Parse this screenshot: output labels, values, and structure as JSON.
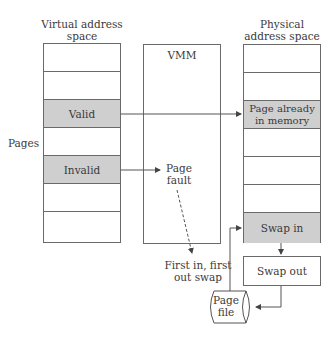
{
  "labels": {
    "virtual_title": "Virtual address space",
    "physical_title": "Physical address space",
    "vmm": "VMM",
    "pages": "Pages",
    "page_fault": "Page fault",
    "fifo": "First in, first out swap",
    "swap_out": "Swap out",
    "page_file": "Page file"
  },
  "virtual_rows": [
    "",
    "",
    "Valid",
    "",
    "Invalid",
    "",
    ""
  ],
  "physical_rows": [
    "",
    "",
    "Page already in memory",
    "",
    "",
    "",
    "Swap in"
  ],
  "colors": {
    "shaded": "#cfcfcf",
    "line": "#6a6a6a"
  }
}
